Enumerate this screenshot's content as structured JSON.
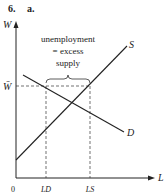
{
  "header": {
    "number": "6.",
    "part": "a."
  },
  "axes": {
    "y_label": "W",
    "x_label": "L",
    "origin": "0"
  },
  "wage_label": "W̄",
  "curves": {
    "supply": "S",
    "demand": "D"
  },
  "annotation": {
    "line1": "unemployment",
    "line2": "= excess",
    "line3": "supply"
  },
  "ticks": {
    "ld": "LD",
    "ls": "LS"
  }
}
